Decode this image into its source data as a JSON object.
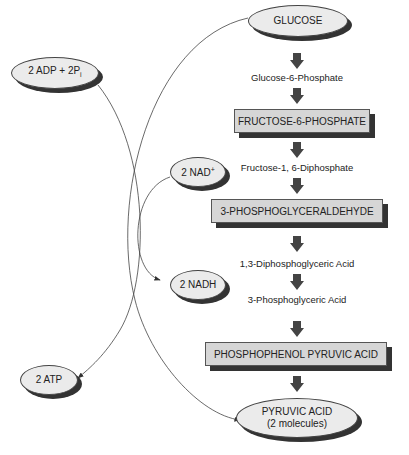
{
  "nodes": {
    "glucose": "GLUCOSE",
    "g6p": "Glucose-6-Phosphate",
    "f6p": "FRUCTOSE-6-PHOSPHATE",
    "f16dp": "Fructose-1, 6-Diphosphate",
    "g3p": "3-PHOSPHOGLYCERALDEHYDE",
    "dpg": "1,3-Diphosphoglyceric Acid",
    "pga": "3-Phosphoglyceric Acid",
    "pep": "PHOSPHOPHENOL PYRUVIC ACID",
    "pyruvic_line1": "PYRUVIC ACID",
    "pyruvic_line2": "(2 molecules)"
  },
  "side": {
    "adp": "2 ADP + 2P",
    "adp_sub": "i",
    "nad": "2 NAD",
    "nad_sup": "+",
    "nadh": "2 NADH",
    "atp": "2 ATP"
  }
}
